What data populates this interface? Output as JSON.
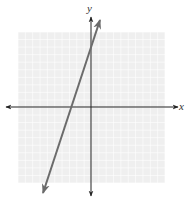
{
  "top_note": "",
  "chart_data": {
    "type": "line",
    "title": "",
    "xlabel": "x",
    "ylabel": "y",
    "xlim": [
      -10,
      10
    ],
    "ylim": [
      -10,
      10
    ],
    "grid": true,
    "grid_step": 1,
    "legend": null,
    "series": [
      {
        "name": "line",
        "equation": "y = 3x + 9",
        "slope": 3,
        "y_intercept": 9,
        "x_intercept": -3,
        "x": [
          -6.5,
          1.3
        ],
        "y": [
          -10.5,
          12.9
        ],
        "arrows_both_ends": true,
        "color": "#6b6b6b"
      }
    ],
    "axes": {
      "x_arrows_both_ends": true,
      "y_arrows_both_ends": true,
      "color": "#222222"
    },
    "grid_color": "#e6e6e6",
    "grid_background": "#efefef"
  }
}
